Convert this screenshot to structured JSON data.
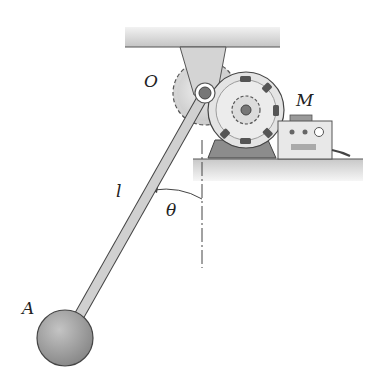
{
  "figure": {
    "type": "mechanics-diagram",
    "labels": {
      "pivot": "O",
      "motor": "M",
      "length": "l",
      "angle": "θ",
      "mass": "A"
    },
    "colors": {
      "ceiling": "#cfcfcf",
      "bracket": "#d6d6d6",
      "gear": "#dcdcdc",
      "motor_body": "#e2e2e2",
      "motor_slots": "#555555",
      "motor_base": "#8a8a8a",
      "rod": "#cfcfcf",
      "ball": "#9a9a9a",
      "control_box": "#e6e6e6",
      "stroke": "#444444"
    }
  }
}
